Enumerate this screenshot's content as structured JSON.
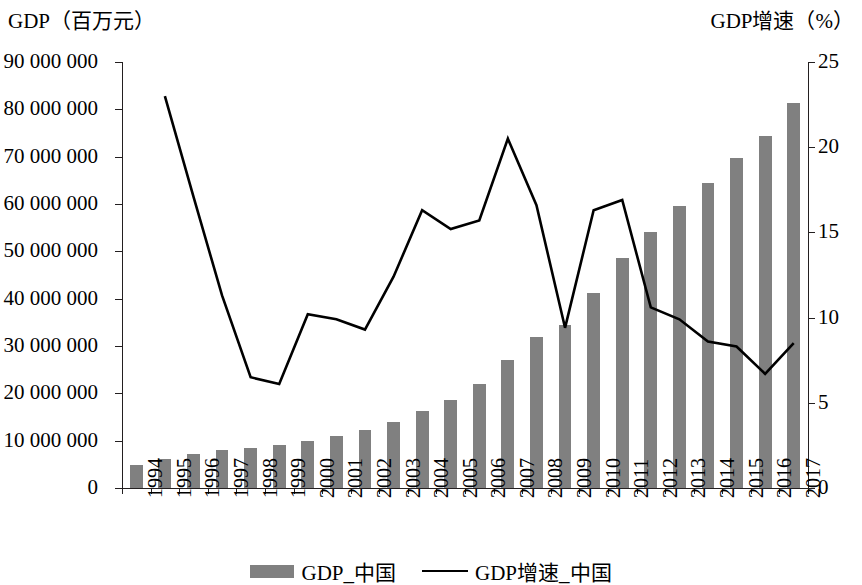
{
  "chart_data": {
    "type": "bar",
    "title": "",
    "xlabel": "",
    "ylabel": "GDP（百万元）",
    "y2label": "GDP增速（%）",
    "categories": [
      "1994",
      "1995",
      "1996",
      "1997",
      "1998",
      "1999",
      "2000",
      "2001",
      "2002",
      "2003",
      "2004",
      "2005",
      "2006",
      "2007",
      "2008",
      "2009",
      "2010",
      "2011",
      "2012",
      "2013",
      "2014",
      "2015",
      "2016",
      "2017"
    ],
    "ylim": [
      0,
      90000000
    ],
    "y2lim": [
      0,
      25
    ],
    "yticks": [
      0,
      10000000,
      20000000,
      30000000,
      40000000,
      50000000,
      60000000,
      70000000,
      80000000,
      90000000
    ],
    "ytick_labels": [
      "0",
      "10 000 000",
      "20 000 000",
      "30 000 000",
      "40 000 000",
      "50 000 000",
      "60 000 000",
      "70 000 000",
      "80 000 000",
      "90 000 000"
    ],
    "y2ticks": [
      0,
      5,
      10,
      15,
      20,
      25
    ],
    "y2tick_labels": [
      "0",
      "5",
      "10",
      "15",
      "20",
      "25"
    ],
    "grid": false,
    "legend_position": "bottom",
    "series": [
      {
        "name": "GDP_中国",
        "type": "bar",
        "axis": "left",
        "color": "#808080",
        "values": [
          4900000,
          6100000,
          7200000,
          8000000,
          8500000,
          9000000,
          10000000,
          11000000,
          12200000,
          13900000,
          16200000,
          18700000,
          22000000,
          27000000,
          32000000,
          34500000,
          41100000,
          48500000,
          54000000,
          59500000,
          64500000,
          69800000,
          74400000,
          81300000
        ]
      },
      {
        "name": "GDP增速_中国",
        "type": "line",
        "axis": "right",
        "color": "#000000",
        "start_category": "1995",
        "values": [
          null,
          23.0,
          17.1,
          11.3,
          6.5,
          6.1,
          10.2,
          9.9,
          9.3,
          12.4,
          16.3,
          15.2,
          15.7,
          20.5,
          16.6,
          9.4,
          16.3,
          16.9,
          10.6,
          9.9,
          8.6,
          8.3,
          6.7,
          8.5
        ]
      }
    ]
  },
  "legend": {
    "entries": [
      {
        "label": "GDP_中国",
        "marker": "bar-swatch"
      },
      {
        "label": "GDP增速_中国",
        "marker": "line-swatch"
      }
    ]
  }
}
